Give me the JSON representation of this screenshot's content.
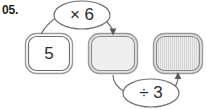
{
  "problem": {
    "number_label": "05.",
    "type": "function-machine-flow-diagram"
  },
  "nodes": [
    {
      "id": "node-1",
      "name": "start-value-box",
      "value": "5",
      "state": "filled-in",
      "style": "double-outline-white",
      "x": 25,
      "y": 33,
      "width": 48,
      "height": 41
    },
    {
      "id": "node-2",
      "name": "answer-box-1",
      "value": "",
      "state": "blank",
      "style": "gray-shaded",
      "x": 88,
      "y": 33,
      "width": 50,
      "height": 41
    },
    {
      "id": "node-3",
      "name": "answer-box-2",
      "value": "",
      "state": "blank",
      "style": "gray-striped",
      "x": 153,
      "y": 33,
      "width": 50,
      "height": 41
    }
  ],
  "operations": [
    {
      "id": "op-1",
      "name": "multiply-operation",
      "symbol": "×",
      "operand": "6",
      "label": "× 6",
      "from": "node-1",
      "to": "node-2",
      "cx": 82,
      "cy": 15,
      "rx": 28,
      "ry": 14
    },
    {
      "id": "op-2",
      "name": "divide-operation",
      "symbol": "÷",
      "operand": "3",
      "label": "÷ 3",
      "from": "node-2",
      "to": "node-3",
      "cx": 151,
      "cy": 93,
      "rx": 28,
      "ry": 14
    }
  ],
  "colors": {
    "ink": "#2b2b2b",
    "label_ink": "#231f20",
    "stroke": "#6f6f6f",
    "stroke_light": "#9a9a9a",
    "box_fill_blank": "#e9e9e9",
    "box_fill_white": "#ffffff",
    "stripe": "#d6d6d6",
    "background": "#ffffff"
  }
}
